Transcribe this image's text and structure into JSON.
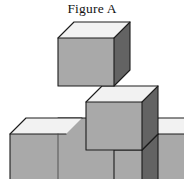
{
  "figure": {
    "title": "Figure A",
    "caption_label": "Figure A",
    "cube_count_visible": 6
  },
  "colors": {
    "background": "#ffffff",
    "top_face": "#f2f2f2",
    "left_face": "#a9a9a9",
    "right_face": "#636363",
    "outline": "#1c1c1c",
    "inner_edge": "#4a4a4a",
    "title_text": "#131313"
  },
  "geometry": {
    "projection": "isometric",
    "cube_width_px": 56,
    "cube_height_px": 56,
    "iso_rise_px": 16,
    "image_width_px": 184,
    "image_height_px": 179,
    "cubes": [
      {
        "name": "top-cube",
        "column": 1,
        "row": 3,
        "origin_x": 58,
        "origin_y": 38
      },
      {
        "name": "middle-right-cube",
        "column": 2,
        "row": 2,
        "origin_x": 86,
        "origin_y": 102
      },
      {
        "name": "bottom-left-cube",
        "column": 0,
        "row": 1,
        "origin_x": 10,
        "origin_y": 134
      },
      {
        "name": "bottom-mid-cube",
        "column": 1,
        "row": 1,
        "origin_x": 58,
        "origin_y": 118
      },
      {
        "name": "bottom-right-cube",
        "column": 2,
        "row": 1,
        "origin_x": 86,
        "origin_y": 150
      },
      {
        "name": "far-right-cube",
        "column": 3,
        "row": 1,
        "origin_x": 142,
        "origin_y": 134
      }
    ]
  }
}
